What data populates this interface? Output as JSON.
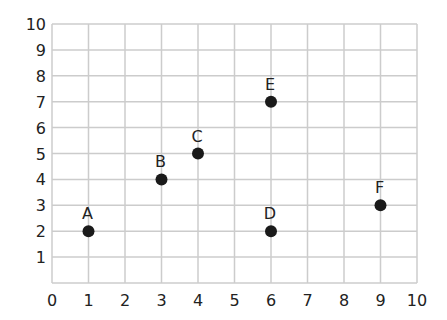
{
  "chart_data": {
    "type": "scatter",
    "title": "",
    "xlabel": "",
    "ylabel": "",
    "xlim": [
      0,
      10
    ],
    "ylim": [
      0,
      10
    ],
    "grid": true,
    "x_ticks": [
      0,
      1,
      2,
      3,
      4,
      5,
      6,
      7,
      8,
      9,
      10
    ],
    "y_ticks": [
      1,
      2,
      3,
      4,
      5,
      6,
      7,
      8,
      9,
      10
    ],
    "points": [
      {
        "label": "A",
        "x": 1,
        "y": 2
      },
      {
        "label": "B",
        "x": 3,
        "y": 4
      },
      {
        "label": "C",
        "x": 4,
        "y": 5
      },
      {
        "label": "D",
        "x": 6,
        "y": 2
      },
      {
        "label": "E",
        "x": 6,
        "y": 7
      },
      {
        "label": "F",
        "x": 9,
        "y": 3
      }
    ],
    "colors": {
      "grid": "#cccccc",
      "point": "#1a1a1a",
      "text": "#222222"
    }
  }
}
